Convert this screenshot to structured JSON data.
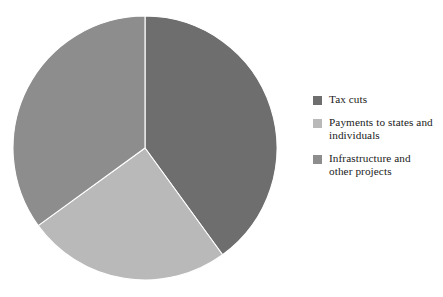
{
  "chart_data": {
    "type": "pie",
    "title": "",
    "subtitle": "",
    "xlabel": "",
    "ylabel": "",
    "grid": false,
    "legend_position": "right",
    "start_angle_deg": 0,
    "direction": "clockwise",
    "center": {
      "x": 145,
      "y": 148
    },
    "radius": 132,
    "categories": [
      "Tax cuts",
      "Payments to states and individuals",
      "Infrastructure and other projects"
    ],
    "values": [
      40,
      25,
      35
    ],
    "slices": [
      {
        "label": "Tax cuts",
        "value": 40,
        "color": "#6e6e6e",
        "start_deg": 0,
        "end_deg": 144
      },
      {
        "label": "Payments to states and individuals",
        "value": 25,
        "color": "#b9b9b9",
        "start_deg": 144,
        "end_deg": 234
      },
      {
        "label": "Infrastructure and other projects",
        "value": 35,
        "color": "#8d8d8d",
        "start_deg": 234,
        "end_deg": 360
      }
    ]
  },
  "legend": {
    "items": [
      {
        "label": "Tax cuts",
        "color": "#6e6e6e",
        "swatch_name": "legend-swatch-tax-cuts"
      },
      {
        "label": "Payments to states and\nindividuals",
        "color": "#b9b9b9",
        "swatch_name": "legend-swatch-payments"
      },
      {
        "label": "Infrastructure and\nother projects",
        "color": "#8d8d8d",
        "swatch_name": "legend-swatch-infrastructure"
      }
    ]
  },
  "style": {
    "background": "#ffffff",
    "slice_divider_color": "#ffffff",
    "text_color": "#1a1a1a"
  }
}
